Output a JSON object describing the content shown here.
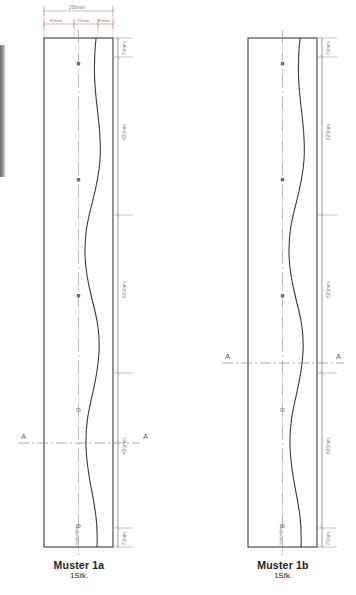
{
  "drawing": {
    "title_hidden": "",
    "panels": [
      {
        "id": "panel-a",
        "caption": "Muster 1a",
        "quantity": "1Stk.",
        "top_chain": {
          "total_label": "200mm",
          "segments": [
            "85mm",
            "70mm",
            "45mm"
          ]
        },
        "side_dimensions": [
          "70mm",
          "620mm",
          "620mm",
          "620mm",
          "70mm"
        ],
        "section_label_left": "A",
        "section_label_right": "A",
        "inner_note": "Schnittlinie",
        "node_count": 5
      },
      {
        "id": "panel-b",
        "caption": "Muster 1b",
        "quantity": "1Stk.",
        "top_chain": {
          "total_label": "",
          "segments": []
        },
        "side_dimensions": [
          "70mm",
          "620mm",
          "620mm",
          "620mm",
          "70mm"
        ],
        "section_label_left": "A",
        "section_label_right": "A",
        "inner_note": "Schnittlinie",
        "node_count": 5
      }
    ],
    "colors": {
      "outline": "#3b3b3b",
      "curve": "#3b3b3b",
      "dimension": "#9a9a9a",
      "red_dimension": "#e06a76",
      "centerline": "#8a8a8a",
      "section_line": "#8a8a8a",
      "scrollbar": "#767676"
    }
  }
}
